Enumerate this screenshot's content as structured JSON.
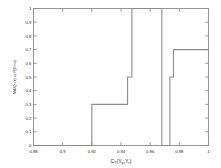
{
  "chart_data": {
    "type": "line",
    "subtype": "empirical-cdf-staircase",
    "title": "",
    "xlabel": "C_T(Y_p, Y_r)",
    "xlabel_parts": {
      "main1": "C",
      "sub1": "T",
      "main2": "(Y",
      "sub2": "p",
      "main3": ",Y",
      "sub3": "r",
      "main4": ")"
    },
    "ylabel": "MAX(<=x) vs P(X<=x)",
    "xlim": [
      0.88,
      1.0
    ],
    "ylim": [
      0.0,
      1.0
    ],
    "xticks": [
      0.88,
      0.9,
      0.92,
      0.94,
      0.96,
      0.98,
      1
    ],
    "xticklabels": [
      "0.88",
      "0.9",
      "0.92",
      "0.94",
      "0.96",
      "0.98",
      "1"
    ],
    "yticks": [
      0,
      0.1,
      0.2,
      0.3,
      0.4,
      0.5,
      0.6,
      0.7,
      0.8,
      0.9,
      1
    ],
    "yticklabels": [
      "0",
      "0.1",
      "0.2",
      "0.3",
      "0.4",
      "0.5",
      "0.6",
      "0.7",
      "0.8",
      "0.9",
      "1"
    ],
    "grid": false,
    "legend": null,
    "line_color": "#8c8c8c",
    "axis_color": "#8c8c8c",
    "line_width": 1.1,
    "steps": [
      {
        "x": 0.88,
        "y": 0.0
      },
      {
        "x": 0.92,
        "y": 0.0
      },
      {
        "x": 0.92,
        "y": 0.3
      },
      {
        "x": 0.9445,
        "y": 0.3
      },
      {
        "x": 0.9445,
        "y": 0.5
      },
      {
        "x": 0.9475,
        "y": 0.5
      },
      {
        "x": 0.9475,
        "y": 1.0
      },
      {
        "x": 0.968,
        "y": 1.0
      },
      {
        "x": 0.968,
        "y": 0.0
      },
      {
        "x": 0.9735,
        "y": 0.0
      },
      {
        "x": 0.9735,
        "y": 0.5
      },
      {
        "x": 0.976,
        "y": 0.5
      },
      {
        "x": 0.976,
        "y": 0.7
      },
      {
        "x": 1.0,
        "y": 0.7
      }
    ],
    "series": [
      {
        "name": "ecdf",
        "x": [
          0.88,
          0.92,
          0.92,
          0.9445,
          0.9445,
          0.9475,
          0.9475,
          0.968,
          0.968,
          0.9735,
          0.9735,
          0.976,
          0.976,
          1.0
        ],
        "values": [
          0.0,
          0.0,
          0.3,
          0.3,
          0.5,
          0.5,
          1.0,
          1.0,
          0.0,
          0.0,
          0.5,
          0.5,
          0.7,
          0.7
        ]
      }
    ]
  }
}
